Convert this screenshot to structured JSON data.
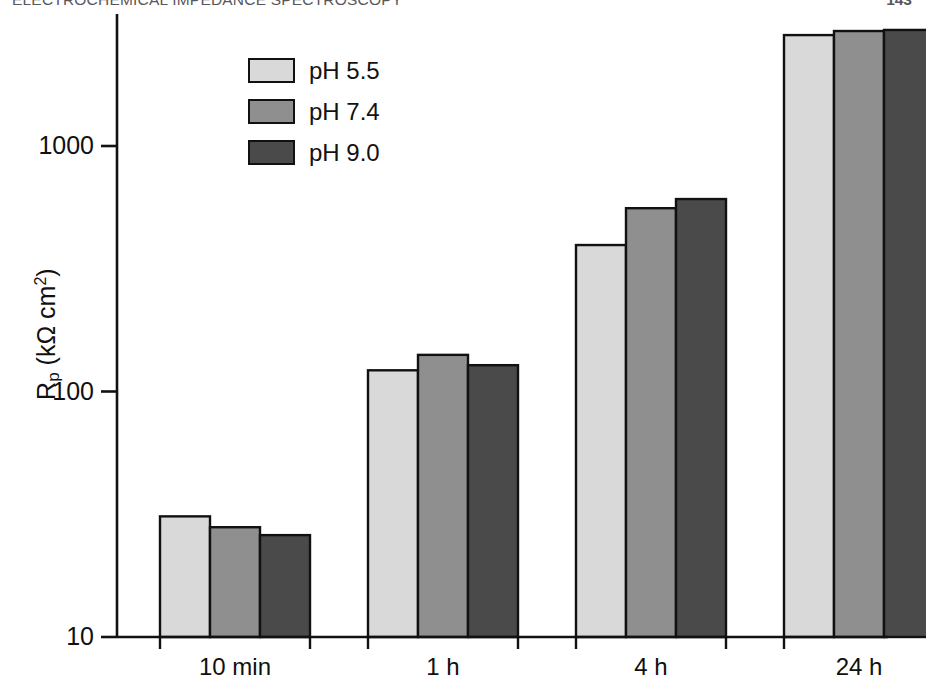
{
  "header": {
    "title": "ELECTROCHEMICAL IMPEDANCE SPECTROSCOPY",
    "page_number": "143"
  },
  "figure": {
    "y_axis_label_main": "R",
    "y_axis_label_sub": "p",
    "y_axis_label_unit": " (kΩ  cm",
    "y_axis_label_exp": "2",
    "y_axis_label_close": ")",
    "y_axis_label_full": "Rp (kΩ cm2)"
  },
  "chart_data": {
    "type": "bar",
    "title": "",
    "subtitle": "",
    "xlabel": "",
    "ylabel": "Rp (kΩ cm2)",
    "yscale": "log",
    "ylim": [
      10,
      4000
    ],
    "yticks": [
      10,
      100,
      1000
    ],
    "ytick_labels": [
      "10",
      "100",
      "1000"
    ],
    "grid": false,
    "legend_position": "upper-left-inside",
    "categories": [
      "10 min",
      "1 h",
      "4 h",
      "24 h"
    ],
    "series": [
      {
        "name": "pH 5.5",
        "color": "#d9d9d9",
        "values": [
          31,
          122,
          395,
          2830
        ]
      },
      {
        "name": "pH 7.4",
        "color": "#8f8f8f",
        "values": [
          28,
          141,
          558,
          2940
        ]
      },
      {
        "name": "pH 9.0",
        "color": "#4a4a4a",
        "values": [
          26,
          128,
          608,
          2970
        ]
      }
    ],
    "bar_edge_color": "#111111",
    "axis_color": "#111111"
  }
}
